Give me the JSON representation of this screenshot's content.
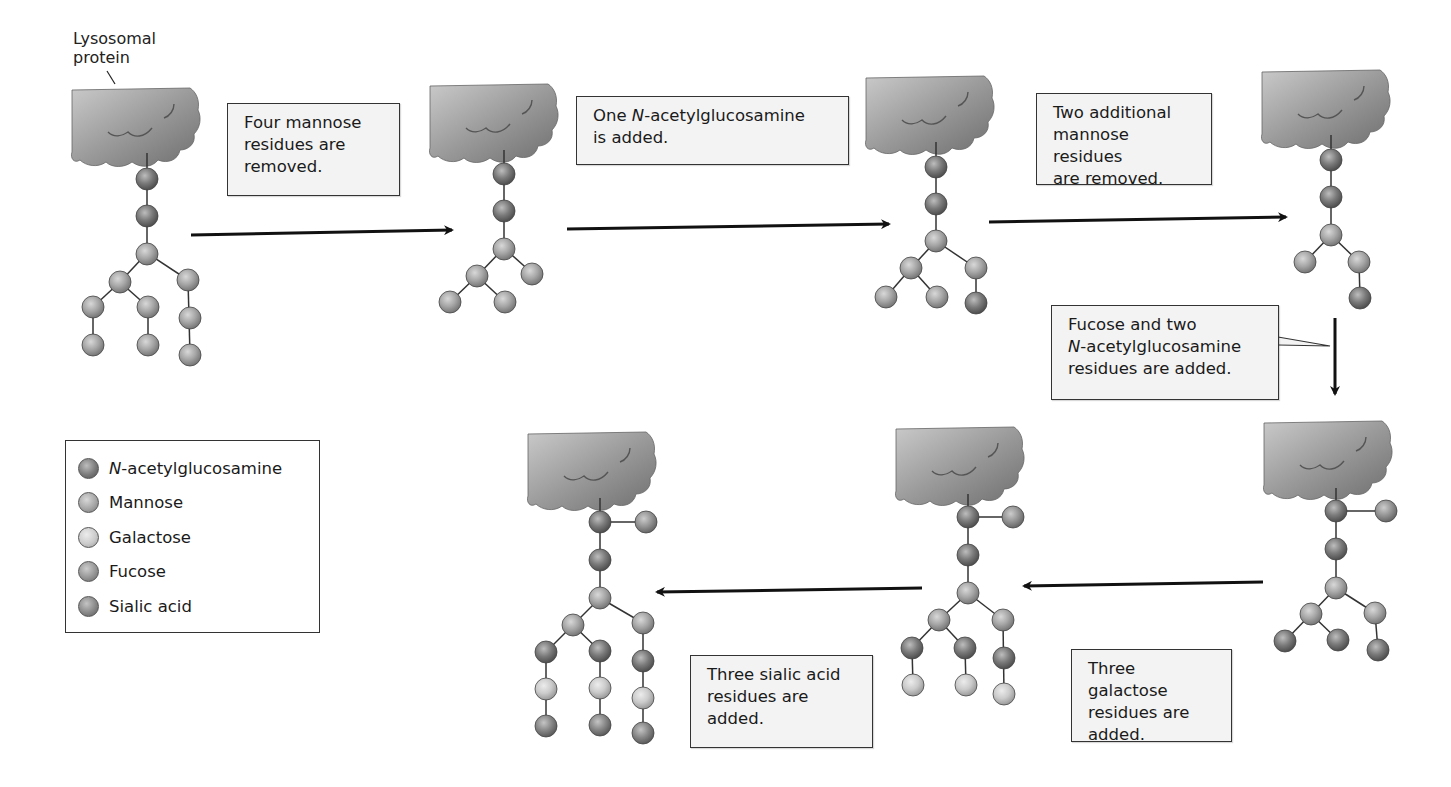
{
  "title_label": {
    "line1": "Lysosomal",
    "line2": "protein"
  },
  "colors": {
    "nag": "#6f6f6f",
    "mannose": "#a8a8a8",
    "galactose": "#cfcfcf",
    "fucose": "#8e8e8e",
    "sialic": "#858585",
    "protein": "#8c8c8c",
    "arrow": "#111111"
  },
  "steps": [
    {
      "id": 1,
      "text_prefix": "",
      "text_italic": "",
      "text": "Four mannose residues are removed."
    },
    {
      "id": 2,
      "text_prefix": "One ",
      "text_italic": "N",
      "text": "-acetylglucosamine is added."
    },
    {
      "id": 3,
      "text_prefix": "",
      "text_italic": "",
      "text": "Two additional mannose residues are removed."
    },
    {
      "id": 4,
      "text_prefix": "Fucose and two ",
      "text_italic": "N",
      "text": "-acetylglucosamine residues are added."
    },
    {
      "id": 5,
      "text_prefix": "",
      "text_italic": "",
      "text": "Three galactose residues are added."
    },
    {
      "id": 6,
      "text_prefix": "",
      "text_italic": "",
      "text": "Three sialic acid residues are added."
    }
  ],
  "captions": {
    "step1": {
      "l1": "Four mannose",
      "l2": "residues are",
      "l3": "removed."
    },
    "step2": {
      "l1a": "One ",
      "l1i": "N",
      "l1b": "-acetylglucosamine",
      "l2": "is added."
    },
    "step3": {
      "l1": "Two additional",
      "l2": "mannose residues",
      "l3": "are removed."
    },
    "step4": {
      "l1": "Fucose and two",
      "l2i": "N",
      "l2b": "-acetylglucosamine",
      "l3": "residues are added."
    },
    "step5": {
      "l1": "Three galactose",
      "l2": "residues are",
      "l3": "added."
    },
    "step6": {
      "l1": "Three sialic acid",
      "l2": "residues are",
      "l3": "added."
    }
  },
  "legend": {
    "items": [
      {
        "italic": "N",
        "label": "-acetylglucosamine",
        "key": "nag"
      },
      {
        "italic": "",
        "label": "Mannose",
        "key": "mannose"
      },
      {
        "italic": "",
        "label": "Galactose",
        "key": "galactose"
      },
      {
        "italic": "",
        "label": "Fucose",
        "key": "fucose"
      },
      {
        "italic": "",
        "label": "Sialic acid",
        "key": "sialic"
      }
    ]
  },
  "structures": [
    {
      "name": "oligosaccharide-1",
      "residues": [
        "NAG",
        "NAG",
        "Man",
        "Man",
        "Man",
        "Man",
        "Man",
        "Man",
        "Man",
        "Man",
        "Man"
      ]
    },
    {
      "name": "oligosaccharide-2",
      "residues": [
        "NAG",
        "NAG",
        "Man",
        "Man",
        "Man",
        "Man",
        "Man"
      ]
    },
    {
      "name": "oligosaccharide-3",
      "residues": [
        "NAG",
        "NAG",
        "Man",
        "Man",
        "Man",
        "Man",
        "Man",
        "NAG"
      ]
    },
    {
      "name": "oligosaccharide-4",
      "residues": [
        "NAG",
        "NAG",
        "Man",
        "Man",
        "Man",
        "NAG"
      ]
    },
    {
      "name": "oligosaccharide-5",
      "residues": [
        "NAG",
        "Fuc",
        "NAG",
        "Man",
        "Man",
        "Man",
        "NAG",
        "NAG",
        "NAG"
      ]
    },
    {
      "name": "oligosaccharide-6",
      "residues": [
        "NAG",
        "Fuc",
        "NAG",
        "Man",
        "Man",
        "Man",
        "NAG",
        "NAG",
        "NAG",
        "Gal",
        "Gal",
        "Gal"
      ]
    },
    {
      "name": "oligosaccharide-7",
      "residues": [
        "NAG",
        "Fuc",
        "NAG",
        "Man",
        "Man",
        "Man",
        "NAG",
        "NAG",
        "NAG",
        "Gal",
        "Gal",
        "Gal",
        "Sia",
        "Sia",
        "Sia"
      ]
    }
  ]
}
